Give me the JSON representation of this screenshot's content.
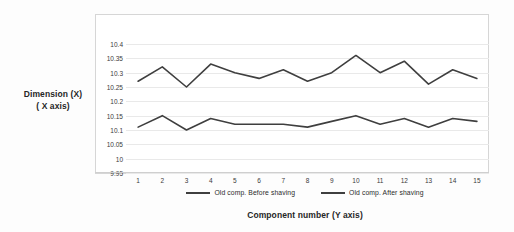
{
  "chart_data": {
    "type": "line",
    "title": "",
    "xlabel": "Component number (Y axis)",
    "ylabel_line1": "Dimension (X)",
    "ylabel_line2": "( X axis)",
    "categories": [
      "1",
      "2",
      "3",
      "4",
      "5",
      "6",
      "7",
      "8",
      "9",
      "10",
      "11",
      "12",
      "13",
      "14",
      "15"
    ],
    "x": [
      1,
      2,
      3,
      4,
      5,
      6,
      7,
      8,
      9,
      10,
      11,
      12,
      13,
      14,
      15
    ],
    "yticks": [
      "10.4",
      "10.35",
      "10.3",
      "10.25",
      "10.2",
      "10.15",
      "10.1",
      "10.05",
      "10",
      "9.95"
    ],
    "ytick_values": [
      10.4,
      10.35,
      10.3,
      10.25,
      10.2,
      10.15,
      10.1,
      10.05,
      10.0,
      9.95
    ],
    "ylim": [
      9.95,
      10.425
    ],
    "grid": true,
    "legend_position": "bottom",
    "series": [
      {
        "name": "Old comp. Before shaving",
        "color": "#3f3f3f",
        "values": [
          10.27,
          10.32,
          10.25,
          10.33,
          10.3,
          10.28,
          10.31,
          10.27,
          10.3,
          10.36,
          10.3,
          10.34,
          10.26,
          10.31,
          10.28
        ]
      },
      {
        "name": "Old comp. After shaving",
        "color": "#3f3f3f",
        "values": [
          10.11,
          10.15,
          10.1,
          10.14,
          10.12,
          10.12,
          10.12,
          10.11,
          10.13,
          10.15,
          10.12,
          10.14,
          10.11,
          10.14,
          10.13
        ]
      }
    ]
  },
  "axis_titles": {
    "y_line1": "Dimension (X)",
    "y_line2": "( X axis)",
    "x": "Component number (Y axis)"
  },
  "legend": {
    "items": [
      {
        "label": "Old comp. Before shaving"
      },
      {
        "label": "Old comp. After shaving"
      }
    ]
  }
}
